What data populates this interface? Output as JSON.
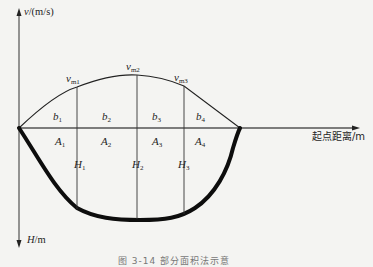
{
  "figure": {
    "v_axis_label": "v",
    "v_axis_unit": "/(m/s)",
    "h_axis_label": "H",
    "h_axis_unit": "/m",
    "x_axis_label": "起点距离/m",
    "caption": "图 3-14  部分面积法示意",
    "velocity_labels": [
      {
        "base": "v",
        "sub": "m1"
      },
      {
        "base": "v",
        "sub": "m2"
      },
      {
        "base": "v",
        "sub": "m3"
      }
    ],
    "width_labels": [
      {
        "base": "b",
        "sub": "1"
      },
      {
        "base": "b",
        "sub": "2"
      },
      {
        "base": "b",
        "sub": "3"
      },
      {
        "base": "b",
        "sub": "4"
      }
    ],
    "area_labels": [
      {
        "base": "A",
        "sub": "1"
      },
      {
        "base": "A",
        "sub": "2"
      },
      {
        "base": "A",
        "sub": "3"
      },
      {
        "base": "A",
        "sub": "4"
      }
    ],
    "depth_labels": [
      {
        "base": "H",
        "sub": "1"
      },
      {
        "base": "H",
        "sub": "2"
      },
      {
        "base": "H",
        "sub": "3"
      }
    ],
    "colors": {
      "background": "#f4f4f2",
      "line": "#1e1e1e",
      "bed": "#0d0d0d"
    }
  }
}
